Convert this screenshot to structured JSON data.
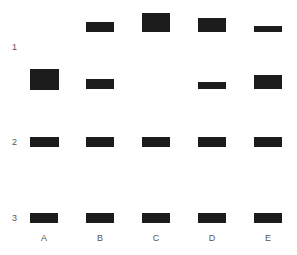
{
  "rows": [
    {
      "label": "1",
      "y": 42
    },
    {
      "label": "2",
      "y": 137
    },
    {
      "label": "3",
      "y": 213
    }
  ],
  "columns": [
    {
      "label": "A",
      "x": 30
    },
    {
      "label": "B",
      "x": 86
    },
    {
      "label": "C",
      "x": 142
    },
    {
      "label": "D",
      "x": 198
    },
    {
      "label": "E",
      "x": 254
    }
  ],
  "band_color": "#1c1c1c",
  "bands": [
    {
      "row": "1",
      "col": "B",
      "x": 86,
      "y": 22,
      "w": 28,
      "h": 10
    },
    {
      "row": "1",
      "col": "C",
      "x": 142,
      "y": 13,
      "w": 28,
      "h": 19
    },
    {
      "row": "1",
      "col": "D",
      "x": 198,
      "y": 18,
      "w": 28,
      "h": 14
    },
    {
      "row": "1",
      "col": "E",
      "x": 254,
      "y": 26,
      "w": 28,
      "h": 6
    },
    {
      "row": "1",
      "col": "A",
      "x": 30,
      "y": 69,
      "w": 29,
      "h": 21
    },
    {
      "row": "1",
      "col": "B",
      "x": 86,
      "y": 79,
      "w": 28,
      "h": 10
    },
    {
      "row": "1",
      "col": "D",
      "x": 198,
      "y": 82,
      "w": 28,
      "h": 7
    },
    {
      "row": "1",
      "col": "E",
      "x": 254,
      "y": 75,
      "w": 28,
      "h": 14
    },
    {
      "row": "2",
      "col": "A",
      "x": 30,
      "y": 137,
      "w": 29,
      "h": 10
    },
    {
      "row": "2",
      "col": "B",
      "x": 86,
      "y": 137,
      "w": 28,
      "h": 10
    },
    {
      "row": "2",
      "col": "C",
      "x": 142,
      "y": 137,
      "w": 28,
      "h": 10
    },
    {
      "row": "2",
      "col": "D",
      "x": 198,
      "y": 137,
      "w": 28,
      "h": 10
    },
    {
      "row": "2",
      "col": "E",
      "x": 254,
      "y": 137,
      "w": 28,
      "h": 10
    },
    {
      "row": "3",
      "col": "A",
      "x": 30,
      "y": 213,
      "w": 28,
      "h": 10
    },
    {
      "row": "3",
      "col": "B",
      "x": 86,
      "y": 213,
      "w": 28,
      "h": 10
    },
    {
      "row": "3",
      "col": "C",
      "x": 142,
      "y": 213,
      "w": 28,
      "h": 10
    },
    {
      "row": "3",
      "col": "D",
      "x": 198,
      "y": 213,
      "w": 28,
      "h": 10
    },
    {
      "row": "3",
      "col": "E",
      "x": 254,
      "y": 213,
      "w": 28,
      "h": 10
    }
  ]
}
